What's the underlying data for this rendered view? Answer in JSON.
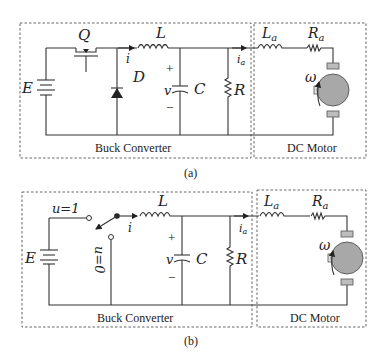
{
  "panels": [
    {
      "id": "a",
      "caption": "(a)",
      "converter_label": "Buck Converter",
      "motor_label": "DC Motor",
      "components": {
        "source": "E",
        "switch": "Q",
        "diode": "D",
        "inductor": "L",
        "current": "i",
        "voltage": "v",
        "capacitor": "C",
        "resistor": "R",
        "armature_current": "i",
        "armature_current_sub": "a",
        "armature_inductor": "L",
        "armature_inductor_sub": "a",
        "armature_resistor": "R",
        "armature_resistor_sub": "a",
        "speed": "ω",
        "plus": "+",
        "minus": "−"
      }
    },
    {
      "id": "b",
      "caption": "(b)",
      "converter_label": "Buck Converter",
      "motor_label": "DC Motor",
      "components": {
        "source": "E",
        "switch_on": "u=1",
        "switch_off": "u=0",
        "inductor": "L",
        "current": "i",
        "voltage": "v",
        "capacitor": "C",
        "resistor": "R",
        "armature_current": "i",
        "armature_current_sub": "a",
        "armature_inductor": "L",
        "armature_inductor_sub": "a",
        "armature_resistor": "R",
        "armature_resistor_sub": "a",
        "speed": "ω",
        "plus": "+",
        "minus": "−"
      }
    }
  ],
  "colors": {
    "motor_fill": "#a8a8a8",
    "brush_fill": "#bdbdbd",
    "wire": "#333333"
  }
}
